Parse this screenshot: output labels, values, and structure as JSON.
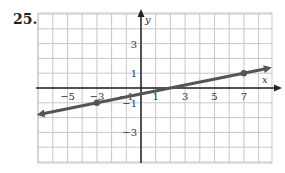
{
  "problem": {
    "number": "25."
  },
  "chart_data": {
    "type": "line",
    "title": "",
    "xlabel": "x",
    "ylabel": "y",
    "xlim": [
      -7,
      9
    ],
    "ylim": [
      -5,
      5
    ],
    "grid": true,
    "x_ticks": [
      -5,
      -3,
      -1,
      1,
      3,
      5,
      7
    ],
    "x_tick_labels": [
      "−5",
      "−3",
      "−1",
      "1",
      "3",
      "5",
      "7"
    ],
    "y_ticks": [
      3,
      1,
      -1,
      -3
    ],
    "y_tick_labels": [
      "3",
      "1",
      "−1",
      "−3"
    ],
    "series": [
      {
        "name": "line",
        "points": [
          {
            "x": -3,
            "y": -1
          },
          {
            "x": 7,
            "y": 1
          }
        ],
        "slope": 0.2,
        "y_intercept": -0.4,
        "arrows_both_ends": true,
        "color": "#555555"
      }
    ]
  },
  "colors": {
    "grid": "#c8c8c8",
    "axis": "#222222",
    "line": "#555555"
  }
}
